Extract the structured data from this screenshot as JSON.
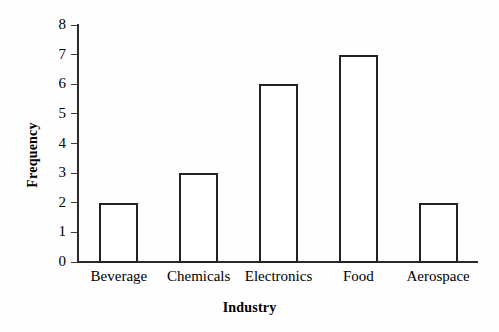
{
  "chart_data": {
    "type": "bar",
    "title": "",
    "subtitle": "",
    "xlabel": "Industry",
    "ylabel": "Frequency",
    "categories": [
      "Beverage",
      "Chemicals",
      "Electronics",
      "Food",
      "Aerospace"
    ],
    "values": [
      2,
      3,
      6,
      7,
      2
    ],
    "ylim": [
      0,
      8
    ],
    "yticks": [
      "0",
      "1",
      "2",
      "3",
      "4",
      "5",
      "6",
      "7",
      "8"
    ],
    "ytick_values": [
      0,
      1,
      2,
      3,
      4,
      5,
      6,
      7,
      8
    ],
    "grid": false,
    "legend": null,
    "legend_position": "none",
    "annotations": [],
    "series": [
      {
        "name": "Frequency",
        "values": [
          2,
          3,
          6,
          7,
          2
        ],
        "bar_fill": "#ffffff",
        "bar_edge": "#222222"
      }
    ]
  },
  "style": {
    "background": "#fefefe",
    "axis_color": "#2a2a2a",
    "text_color": "#000000"
  }
}
